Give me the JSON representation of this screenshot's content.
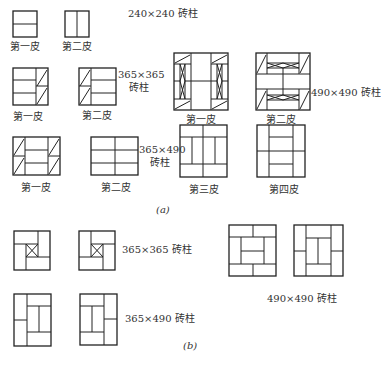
{
  "section_a": {
    "caption": "(a)",
    "group_240": {
      "label": "240×240 砖柱",
      "figures": [
        {
          "label": "第一皮"
        },
        {
          "label": "第二皮"
        }
      ]
    },
    "group_365": {
      "label_line1": "365×365",
      "label_line2": "砖柱",
      "figures": [
        {
          "label": "第一皮"
        },
        {
          "label": "第二皮"
        }
      ]
    },
    "group_490": {
      "label": "490×490 砖柱",
      "figures": [
        {
          "label": "第一皮"
        },
        {
          "label": "第二皮"
        }
      ]
    },
    "group_365x490": {
      "label_line1": "365×490",
      "label_line2": "砖柱",
      "figures": [
        {
          "label": "第一皮"
        },
        {
          "label": "第二皮"
        },
        {
          "label": "第三皮"
        },
        {
          "label": "第四皮"
        }
      ]
    }
  },
  "section_b": {
    "caption": "(b)",
    "group_365": {
      "label": "365×365 砖柱"
    },
    "group_490": {
      "label": "490×490 砖柱"
    },
    "group_365x490": {
      "label": "365×490 砖柱"
    }
  },
  "colors": {
    "line": "#222222",
    "background": "#ffffff"
  }
}
